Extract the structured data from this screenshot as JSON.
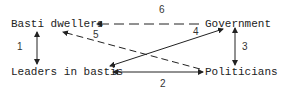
{
  "diagram": {
    "nodes": [
      {
        "id": "basti_dwellers",
        "label": "Basti dwellers"
      },
      {
        "id": "government",
        "label": "Government"
      },
      {
        "id": "leaders",
        "label": "Leaders in bastis"
      },
      {
        "id": "politicians",
        "label": "Politicians"
      }
    ],
    "edges": [
      {
        "id": "1",
        "label": "1",
        "from": "basti_dwellers",
        "to": "leaders",
        "style": "solid",
        "direction": "both"
      },
      {
        "id": "2",
        "label": "2",
        "from": "leaders",
        "to": "politicians",
        "style": "solid",
        "direction": "both"
      },
      {
        "id": "3",
        "label": "3",
        "from": "government",
        "to": "politicians",
        "style": "solid",
        "direction": "both"
      },
      {
        "id": "4",
        "label": "4",
        "from": "leaders",
        "to": "government",
        "style": "solid",
        "direction": "both"
      },
      {
        "id": "5",
        "label": "5",
        "from": "politicians",
        "to": "basti_dwellers",
        "style": "dashed",
        "direction": "to"
      },
      {
        "id": "6",
        "label": "6",
        "from": "government",
        "to": "basti_dwellers",
        "style": "dashed",
        "direction": "to"
      }
    ],
    "colors": {
      "line": "#222222",
      "background": "#ffffff"
    }
  }
}
